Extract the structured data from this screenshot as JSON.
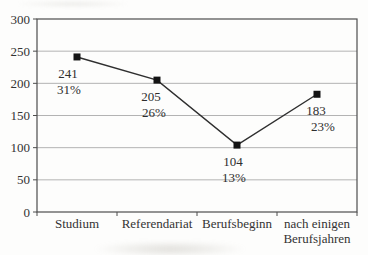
{
  "chart_data": {
    "type": "line",
    "title": "",
    "xlabel": "",
    "ylabel": "",
    "categories": [
      "Studium",
      "Referendariat",
      "Berufsbeginn",
      "nach einigen Berufsjahren"
    ],
    "categories_display": [
      [
        "Studium"
      ],
      [
        "Referendariat"
      ],
      [
        "Berufsbeginn"
      ],
      [
        "nach einigen",
        "Berufsjahren"
      ]
    ],
    "values": [
      241,
      205,
      104,
      183
    ],
    "percent_labels": [
      "31%",
      "26%",
      "13%",
      "23%"
    ],
    "ylim": [
      0,
      300
    ],
    "yticks": [
      0,
      50,
      100,
      150,
      200,
      250,
      300
    ],
    "grid": true,
    "legend": false,
    "marker": "square",
    "colors": {
      "line": "#2f2f2f",
      "marker": "#141414",
      "grid": "#b3b3b3",
      "border": "#4d4d4d",
      "text": "#333333",
      "background": "#fdfdfc"
    }
  }
}
